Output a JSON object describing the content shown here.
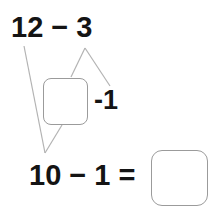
{
  "worksheet": {
    "type": "subtraction-decomposition",
    "top_expression": "12 − 3",
    "bottom_expression": "10 − 1 =",
    "part_label": "-1",
    "part_box_value": "",
    "result_box_value": "",
    "colors": {
      "text": "#141414",
      "line": "#b3b3b3",
      "box_border": "#9b9b9b",
      "background": "#ffffff"
    }
  },
  "connector_lines": [
    {
      "name": "twelve-to-ten",
      "x1": 24,
      "y1": 46,
      "x2": 45,
      "y2": 153
    },
    {
      "name": "three-to-part-box",
      "x1": 85,
      "y1": 48,
      "x2": 71,
      "y2": 77
    },
    {
      "name": "three-to-minus-one",
      "x1": 85,
      "y1": 48,
      "x2": 110,
      "y2": 86
    },
    {
      "name": "part-box-to-ten",
      "x1": 62,
      "y1": 125,
      "x2": 45,
      "y2": 153
    }
  ]
}
